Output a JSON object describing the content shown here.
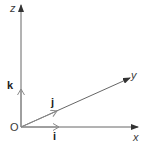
{
  "diagram": {
    "type": "3d-coordinate-axes",
    "origin_label": "O",
    "axes": [
      {
        "name": "x",
        "label": "x"
      },
      {
        "name": "y",
        "label": "y"
      },
      {
        "name": "z",
        "label": "z"
      }
    ],
    "unit_vectors": [
      {
        "name": "i",
        "label": "i",
        "along": "x"
      },
      {
        "name": "j",
        "label": "j",
        "along": "y"
      },
      {
        "name": "k",
        "label": "k",
        "along": "z"
      }
    ],
    "colors": {
      "axis": "#555555",
      "unit_vector": "#9a9a9a",
      "text": "#3a3a3a"
    }
  }
}
